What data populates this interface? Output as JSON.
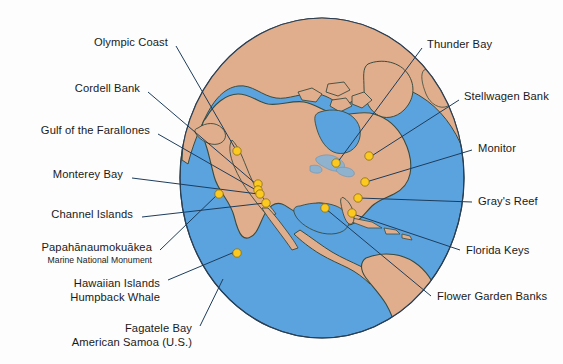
{
  "figure": {
    "type": "globe-locator-map",
    "projection": "orthographic",
    "view_center_hint": "North America / Pacific"
  },
  "colors": {
    "background": "#fdfdfd",
    "ocean": "#5ba3de",
    "land": "#e0ae8c",
    "coastline": "#3a4b3f",
    "globe_outline": "#2b3f52",
    "leader_line": "#1d3c5c",
    "marker_fill": "#fbc91f",
    "marker_stroke": "#8c6d10",
    "label_text": "#1a1a1a"
  },
  "labels": {
    "left": [
      {
        "id": "olympic-coast",
        "name": "Olympic Coast",
        "sub": "",
        "x": 168,
        "y": 42,
        "anchor": "right"
      },
      {
        "id": "cordell-bank",
        "name": "Cordell Bank",
        "sub": "",
        "x": 140,
        "y": 88,
        "anchor": "right"
      },
      {
        "id": "gulf-farallones",
        "name": "Gulf of the Farallones",
        "sub": "",
        "x": 150,
        "y": 130,
        "anchor": "right"
      },
      {
        "id": "monterey-bay",
        "name": "Monterey Bay",
        "sub": "",
        "x": 123,
        "y": 174,
        "anchor": "right"
      },
      {
        "id": "channel-islands",
        "name": "Channel Islands",
        "sub": "",
        "x": 133,
        "y": 214,
        "anchor": "right"
      },
      {
        "id": "papahanaumokuakea",
        "name": "Papahānaumokuākea",
        "sub": "Marine National Monument",
        "x": 152,
        "y": 247,
        "anchor": "right"
      },
      {
        "id": "hawaiian-humpback",
        "name": "Hawaiian Islands",
        "sub": "Humpback Whale",
        "x": 160,
        "y": 283,
        "anchor": "right"
      },
      {
        "id": "fagatele-bay",
        "name": "Fagatele Bay",
        "sub": "American Samoa (U.S.)",
        "x": 192,
        "y": 328,
        "anchor": "right"
      }
    ],
    "right": [
      {
        "id": "thunder-bay",
        "name": "Thunder Bay",
        "sub": "",
        "x": 427,
        "y": 44,
        "anchor": "left"
      },
      {
        "id": "stellwagen-bank",
        "name": "Stellwagen Bank",
        "sub": "",
        "x": 464,
        "y": 96,
        "anchor": "left"
      },
      {
        "id": "monitor",
        "name": "Monitor",
        "sub": "",
        "x": 478,
        "y": 148,
        "anchor": "left"
      },
      {
        "id": "grays-reef",
        "name": "Gray's Reef",
        "sub": "",
        "x": 478,
        "y": 201,
        "anchor": "left"
      },
      {
        "id": "florida-keys",
        "name": "Florida Keys",
        "sub": "",
        "x": 466,
        "y": 250,
        "anchor": "left"
      },
      {
        "id": "flower-garden-banks",
        "name": "Flower Garden Banks",
        "sub": "",
        "x": 437,
        "y": 296,
        "anchor": "left"
      }
    ]
  },
  "markers": [
    {
      "id": "olympic-coast",
      "x": 237,
      "y": 151
    },
    {
      "id": "cordell-bank",
      "x": 258,
      "y": 184
    },
    {
      "id": "gulf-farallones",
      "x": 258,
      "y": 190
    },
    {
      "id": "monterey-bay",
      "x": 260,
      "y": 194
    },
    {
      "id": "channel-islands",
      "x": 266,
      "y": 203
    },
    {
      "id": "thunder-bay",
      "x": 336,
      "y": 163
    },
    {
      "id": "stellwagen-bank",
      "x": 369,
      "y": 156
    },
    {
      "id": "monitor",
      "x": 365,
      "y": 182
    },
    {
      "id": "grays-reef",
      "x": 358,
      "y": 198
    },
    {
      "id": "florida-keys",
      "x": 352,
      "y": 213
    },
    {
      "id": "flower-garden-banks",
      "x": 325,
      "y": 208
    },
    {
      "id": "hawaiian-humpback",
      "x": 237,
      "y": 253
    },
    {
      "id": "papahanaumokuakea",
      "x": 219,
      "y": 194
    }
  ],
  "leaders": [
    {
      "id": "olympic-coast",
      "x1": 176,
      "y1": 46,
      "x2": 236,
      "y2": 150
    },
    {
      "id": "cordell-bank",
      "x1": 148,
      "y1": 92,
      "x2": 256,
      "y2": 184
    },
    {
      "id": "gulf-farallones",
      "x1": 158,
      "y1": 134,
      "x2": 256,
      "y2": 190
    },
    {
      "id": "monterey-bay",
      "x1": 132,
      "y1": 178,
      "x2": 258,
      "y2": 194
    },
    {
      "id": "channel-islands",
      "x1": 142,
      "y1": 217,
      "x2": 265,
      "y2": 203
    },
    {
      "id": "papahanaumokuakea",
      "x1": 160,
      "y1": 250,
      "x2": 219,
      "y2": 193
    },
    {
      "id": "hawaiian-humpback",
      "x1": 168,
      "y1": 280,
      "x2": 237,
      "y2": 251
    },
    {
      "id": "fagatele-bay",
      "x1": 200,
      "y1": 326,
      "x2": 223,
      "y2": 279
    },
    {
      "id": "thunder-bay",
      "x1": 422,
      "y1": 48,
      "x2": 337,
      "y2": 163
    },
    {
      "id": "stellwagen-bank",
      "x1": 459,
      "y1": 100,
      "x2": 370,
      "y2": 157
    },
    {
      "id": "monitor",
      "x1": 472,
      "y1": 150,
      "x2": 366,
      "y2": 182
    },
    {
      "id": "grays-reef",
      "x1": 472,
      "y1": 202,
      "x2": 359,
      "y2": 198
    },
    {
      "id": "florida-keys",
      "x1": 460,
      "y1": 250,
      "x2": 353,
      "y2": 214
    },
    {
      "id": "flower-garden-banks",
      "x1": 431,
      "y1": 296,
      "x2": 326,
      "y2": 209
    }
  ],
  "globe": {
    "cx": 322,
    "cy": 178,
    "rx": 142,
    "ry": 160
  }
}
